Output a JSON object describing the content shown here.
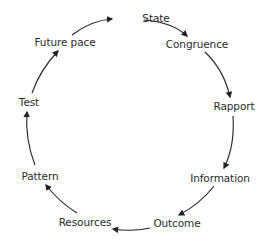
{
  "diagram": {
    "type": "cycle",
    "direction": "clockwise",
    "nodes": [
      {
        "id": "state",
        "label": "State",
        "x": 156,
        "y": 18
      },
      {
        "id": "congruence",
        "label": "Congruence",
        "x": 197,
        "y": 44
      },
      {
        "id": "rapport",
        "label": "Rapport",
        "x": 234,
        "y": 106
      },
      {
        "id": "information",
        "label": "Information",
        "x": 220,
        "y": 178
      },
      {
        "id": "outcome",
        "label": "Outcome",
        "x": 177,
        "y": 223
      },
      {
        "id": "resources",
        "label": "Resources",
        "x": 85,
        "y": 222
      },
      {
        "id": "pattern",
        "label": "Pattern",
        "x": 40,
        "y": 176
      },
      {
        "id": "test",
        "label": "Test",
        "x": 29,
        "y": 102
      },
      {
        "id": "future_pace",
        "label": "Future pace",
        "x": 65,
        "y": 42
      }
    ],
    "edges": [
      {
        "from": "state",
        "to": "congruence"
      },
      {
        "from": "congruence",
        "to": "rapport"
      },
      {
        "from": "rapport",
        "to": "information"
      },
      {
        "from": "information",
        "to": "outcome"
      },
      {
        "from": "outcome",
        "to": "resources"
      },
      {
        "from": "resources",
        "to": "pattern"
      },
      {
        "from": "pattern",
        "to": "test"
      },
      {
        "from": "test",
        "to": "future_pace"
      },
      {
        "from": "future_pace",
        "to": "state"
      }
    ],
    "colors": {
      "line": "#222222",
      "text": "#2a2a2a",
      "background": "#ffffff"
    }
  }
}
